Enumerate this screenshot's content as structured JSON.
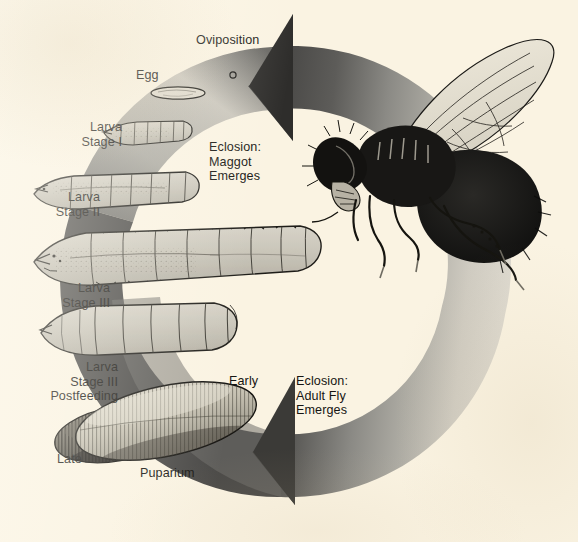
{
  "figure": {
    "background_color": "#faf3e2",
    "ink_color": "#161512"
  },
  "cycle_arrow": {
    "name": "circular-life-cycle-arrow",
    "direction": "clockwise",
    "dark_tone": "#4c4b49",
    "mid_tone": "#8d8c88",
    "light_tone": "#d9d5cc",
    "arrowheads": [
      "top-left-pointing",
      "bottom-left-pointing"
    ]
  },
  "labels": [
    {
      "id": "oviposition",
      "text": "Oviposition",
      "x": 196,
      "y": 33,
      "align": "left"
    },
    {
      "id": "egg",
      "text": "Egg",
      "x": 136,
      "y": 68,
      "align": "left"
    },
    {
      "id": "eclosion-maggot",
      "text": "Eclosion:\nMaggot\nEmerges",
      "x": 209,
      "y": 140,
      "align": "left"
    },
    {
      "id": "larva-1",
      "text": "Larva\nStage I",
      "x": 122,
      "y": 120,
      "align": "right"
    },
    {
      "id": "larva-2",
      "text": "Larva\nStage II",
      "x": 100,
      "y": 190,
      "align": "right"
    },
    {
      "id": "larva-3",
      "text": "Larva\nStage III",
      "x": 110,
      "y": 281,
      "align": "right"
    },
    {
      "id": "larva-3-post",
      "text": "Larva\nStage III\nPostfeeding",
      "x": 118,
      "y": 360,
      "align": "right"
    },
    {
      "id": "early",
      "text": "Early",
      "x": 229,
      "y": 374,
      "align": "left"
    },
    {
      "id": "eclosion-adult",
      "text": "Eclosion:\nAdult Fly\nEmerges",
      "x": 296,
      "y": 374,
      "align": "left"
    },
    {
      "id": "late",
      "text": "Late",
      "x": 57,
      "y": 452,
      "align": "left"
    },
    {
      "id": "puparium",
      "text": "Puparium",
      "x": 140,
      "y": 466,
      "align": "left"
    }
  ],
  "stages": [
    {
      "id": "egg-specimen",
      "name": "egg",
      "description": "small elongated oval egg"
    },
    {
      "id": "oviposition-dot",
      "name": "oviposition-dot",
      "description": "tiny circle marking egg laying"
    },
    {
      "id": "larva-stage-1-specimen",
      "name": "first-instar-larva",
      "description": "small segmented maggot"
    },
    {
      "id": "larva-stage-2-specimen",
      "name": "second-instar-larva",
      "description": "medium segmented maggot"
    },
    {
      "id": "larva-stage-3-specimen",
      "name": "third-instar-larva",
      "description": "large segmented feeding maggot"
    },
    {
      "id": "larva-stage-3-post-specimen",
      "name": "postfeeding-larva",
      "description": "large contracted postfeeding maggot"
    },
    {
      "id": "puparium-early-specimen",
      "name": "early-puparium",
      "description": "pale barrel-shaped puparium"
    },
    {
      "id": "puparium-late-specimen",
      "name": "late-puparium",
      "description": "dark barrel-shaped puparium"
    },
    {
      "id": "adult-fly-specimen",
      "name": "adult-blow-fly",
      "description": "adult fly with veined wing, head at left"
    }
  ]
}
